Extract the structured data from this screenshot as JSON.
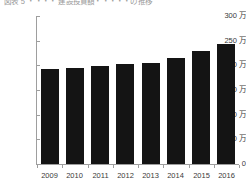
{
  "chart_data": {
    "type": "bar",
    "title": "図表 5 ・・・・ 建設投資額・・・・・の推移",
    "xlabel": "",
    "ylabel": "",
    "categories": [
      "2009",
      "2010",
      "2011",
      "2012",
      "2013",
      "2014",
      "2015",
      "2016"
    ],
    "values": [
      192,
      194,
      198,
      202,
      204,
      214,
      230,
      243
    ],
    "unit": "万",
    "ylim": [
      0,
      300
    ],
    "ytick_values": [
      0,
      50,
      100,
      150,
      200,
      250,
      300
    ],
    "ytick_labels": [
      "0",
      "50 万",
      "100 万",
      "150 万",
      "200 万",
      "250 万",
      "300 万"
    ],
    "grid": false,
    "legend": null,
    "bar_color": "#141414",
    "axis_color": "#9e9e9e"
  },
  "figure": {
    "background": "#ffffff"
  }
}
